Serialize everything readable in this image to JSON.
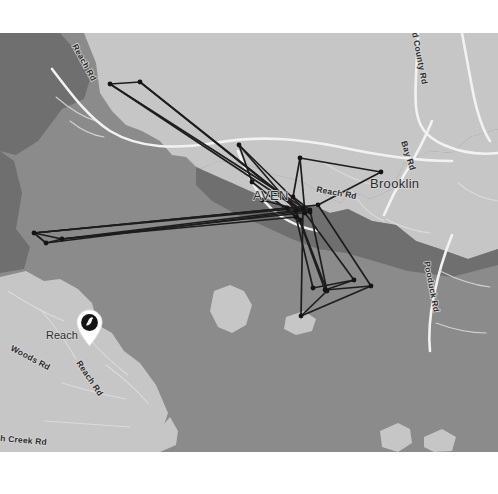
{
  "view": {
    "type": "map-viewer",
    "basemap_style": "grayscale-terrain",
    "frame_background": "#ffffff",
    "water_color": "#8b8b8b",
    "land_color": "#c6c6c6",
    "land_shadow_color": "#6f6f6f",
    "road_major_color": "#f2f2f2",
    "road_minor_color": "#dedede",
    "track_color": "#1d1d1d",
    "label_color": "#2b2b2b",
    "label_halo_color": "#d8d8d8"
  },
  "labels": {
    "places": [
      {
        "name": "place-brooklin",
        "text": "Brooklin",
        "x": 370,
        "y": 188,
        "size": "lbl-place",
        "rotate": 0
      },
      {
        "name": "place-haven",
        "text": "AVEN",
        "x": 253,
        "y": 200,
        "size": "lbl-place",
        "rotate": 0
      },
      {
        "name": "place-reach",
        "text": "Reach",
        "x": 46,
        "y": 339,
        "size": "lbl-place-sm",
        "rotate": 0
      }
    ],
    "roads": [
      {
        "name": "road-label-reach-rd-nw",
        "text": "Reach Rd",
        "x": 72,
        "y": 46,
        "rotate": 61
      },
      {
        "name": "road-label-county-rd",
        "text": "d County Rd",
        "x": 412,
        "y": 33,
        "rotate": 79
      },
      {
        "name": "road-label-bay-rd",
        "text": "Bay Rd",
        "x": 401,
        "y": 142,
        "rotate": 72
      },
      {
        "name": "road-label-reach-rd-mid",
        "text": "Reach Rd",
        "x": 316,
        "y": 192,
        "rotate": 10
      },
      {
        "name": "road-label-pooduck-rd",
        "text": "Pooduck Rd",
        "x": 424,
        "y": 262,
        "rotate": 79
      },
      {
        "name": "road-label-woods-rd",
        "text": "Woods Rd",
        "x": 10,
        "y": 350,
        "rotate": 28
      },
      {
        "name": "road-label-reach-rd-sw",
        "text": "Reach Rd",
        "x": 76,
        "y": 363,
        "rotate": 56
      },
      {
        "name": "road-label-creek-rd",
        "text": "h Creek Rd",
        "x": 0,
        "y": 441,
        "rotate": 5
      }
    ]
  },
  "marker": {
    "name": "location-pin",
    "icon": "bird-pin-icon",
    "x": 75,
    "y": 276,
    "pin_body_color": "#ffffff",
    "pin_disc_color": "#141414",
    "pin_glyph_color": "#f4f4f4"
  },
  "track": {
    "name": "gps-track-overlay",
    "node_count": 26,
    "nodes": [
      [
        110,
        84
      ],
      [
        140,
        82
      ],
      [
        34,
        233
      ],
      [
        62,
        239
      ],
      [
        46,
        243
      ],
      [
        239,
        145
      ],
      [
        252,
        182
      ],
      [
        293,
        197
      ],
      [
        300,
        158
      ],
      [
        381,
        172
      ],
      [
        296,
        211
      ],
      [
        303,
        208
      ],
      [
        310,
        210
      ],
      [
        318,
        205
      ],
      [
        296,
        217
      ],
      [
        300,
        220
      ],
      [
        305,
        213
      ],
      [
        310,
        212
      ],
      [
        325,
        290
      ],
      [
        354,
        280
      ],
      [
        371,
        286
      ],
      [
        301,
        316
      ],
      [
        327,
        291
      ],
      [
        313,
        288
      ],
      [
        287,
        208
      ],
      [
        262,
        200
      ]
    ],
    "segments": [
      [
        [
          110,
          84
        ],
        [
          140,
          82
        ]
      ],
      [
        [
          110,
          84
        ],
        [
          300,
          210
        ]
      ],
      [
        [
          140,
          82
        ],
        [
          300,
          210
        ]
      ],
      [
        [
          110,
          84
        ],
        [
          310,
          212
        ]
      ],
      [
        [
          140,
          82
        ],
        [
          305,
          213
        ]
      ],
      [
        [
          34,
          233
        ],
        [
          62,
          239
        ]
      ],
      [
        [
          34,
          233
        ],
        [
          46,
          243
        ]
      ],
      [
        [
          46,
          243
        ],
        [
          62,
          239
        ]
      ],
      [
        [
          62,
          239
        ],
        [
          300,
          210
        ]
      ],
      [
        [
          34,
          233
        ],
        [
          303,
          208
        ]
      ],
      [
        [
          46,
          243
        ],
        [
          310,
          210
        ]
      ],
      [
        [
          62,
          239
        ],
        [
          296,
          217
        ]
      ],
      [
        [
          34,
          233
        ],
        [
          318,
          205
        ]
      ],
      [
        [
          239,
          145
        ],
        [
          252,
          182
        ]
      ],
      [
        [
          239,
          145
        ],
        [
          296,
          211
        ]
      ],
      [
        [
          252,
          182
        ],
        [
          300,
          220
        ]
      ],
      [
        [
          239,
          145
        ],
        [
          303,
          208
        ]
      ],
      [
        [
          293,
          197
        ],
        [
          300,
          158
        ]
      ],
      [
        [
          300,
          158
        ],
        [
          381,
          172
        ]
      ],
      [
        [
          381,
          172
        ],
        [
          318,
          205
        ]
      ],
      [
        [
          293,
          197
        ],
        [
          310,
          210
        ]
      ],
      [
        [
          300,
          158
        ],
        [
          305,
          213
        ]
      ],
      [
        [
          296,
          211
        ],
        [
          325,
          290
        ]
      ],
      [
        [
          303,
          208
        ],
        [
          301,
          316
        ]
      ],
      [
        [
          310,
          210
        ],
        [
          327,
          291
        ]
      ],
      [
        [
          318,
          205
        ],
        [
          371,
          286
        ]
      ],
      [
        [
          296,
          217
        ],
        [
          313,
          288
        ]
      ],
      [
        [
          305,
          213
        ],
        [
          354,
          280
        ]
      ],
      [
        [
          325,
          290
        ],
        [
          354,
          280
        ]
      ],
      [
        [
          301,
          316
        ],
        [
          371,
          286
        ]
      ],
      [
        [
          301,
          316
        ],
        [
          327,
          291
        ]
      ],
      [
        [
          313,
          288
        ],
        [
          354,
          280
        ]
      ],
      [
        [
          325,
          290
        ],
        [
          371,
          286
        ]
      ],
      [
        [
          300,
          220
        ],
        [
          327,
          291
        ]
      ],
      [
        [
          287,
          208
        ],
        [
          296,
          217
        ]
      ],
      [
        [
          262,
          200
        ],
        [
          300,
          210
        ]
      ],
      [
        [
          34,
          233
        ],
        [
          287,
          208
        ]
      ],
      [
        [
          62,
          239
        ],
        [
          310,
          212
        ]
      ]
    ]
  }
}
